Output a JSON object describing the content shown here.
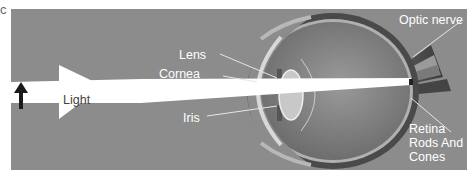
{
  "corner_mark": "c",
  "labels": {
    "light": "Light",
    "lens": "Lens",
    "cornea": "Cornea",
    "iris": "Iris",
    "optic_nerve": "Optic nerve",
    "retina_line1": "Retina",
    "retina_line2": "Rods And",
    "retina_line3": "Cones"
  },
  "colors": {
    "background": "#8c8c8c",
    "light_beam": "#ffffff",
    "arrow": "#1a1a1a",
    "eye_sclera": "#5a5a5a",
    "eye_interior": "#7a7a7a",
    "label_text": "#ffffff"
  }
}
